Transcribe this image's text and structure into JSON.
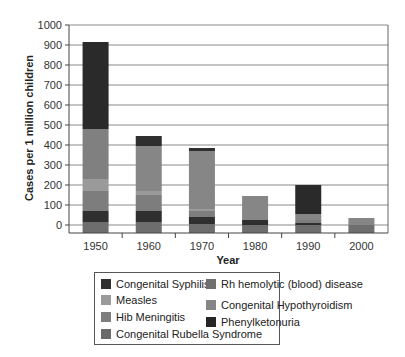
{
  "chart_data": {
    "type": "bar",
    "stacked": true,
    "title": "",
    "xlabel": "Year",
    "ylabel": "Cases per 1 million children",
    "ylim": [
      -50,
      1000
    ],
    "yticks": [
      0,
      100,
      200,
      300,
      400,
      500,
      600,
      700,
      800,
      900,
      1000
    ],
    "grid": true,
    "legend_position": "bottom",
    "categories": [
      "1950",
      "1960",
      "1970",
      "1980",
      "1990",
      "2000"
    ],
    "series": [
      {
        "name": "Congenital Rubella Syndrome",
        "color": "#6e6e6e",
        "values": [
          55,
          55,
          45,
          40,
          40,
          40
        ]
      },
      {
        "name": "Congenital Syphilis",
        "color": "#2f2f2f",
        "values": [
          55,
          55,
          35,
          25,
          10,
          0
        ]
      },
      {
        "name": "Hib Meningitis",
        "color": "#7d7d7d",
        "values": [
          100,
          80,
          30,
          0,
          15,
          0
        ]
      },
      {
        "name": "Measles",
        "color": "#9a9a9a",
        "values": [
          60,
          20,
          10,
          0,
          0,
          0
        ]
      },
      {
        "name": "Rh hemolytic (blood) disease",
        "color": "#808080",
        "values": [
          250,
          0,
          0,
          0,
          0,
          0
        ]
      },
      {
        "name": "Congenital Hypothyroidism",
        "color": "#868686",
        "values": [
          0,
          225,
          290,
          120,
          30,
          35
        ]
      },
      {
        "name": "Phenylketonuria",
        "color": "#2a2a2a",
        "values": [
          435,
          0,
          0,
          0,
          0,
          0
        ]
      },
      {
        "name": "Congenital Syphilis (upper band)",
        "color": "#2f2f2f",
        "values": [
          0,
          50,
          15,
          0,
          0,
          0
        ]
      },
      {
        "name": "Phenylketonuria (1990)",
        "color": "#2a2a2a",
        "values": [
          0,
          0,
          0,
          0,
          145,
          0
        ]
      }
    ],
    "totals_approx": [
      915,
      485,
      425,
      145,
      200,
      35
    ],
    "legend": [
      {
        "label": "Congenital Syphilis",
        "color": "#303030"
      },
      {
        "label": "Measles",
        "color": "#9a9a9a"
      },
      {
        "label": "Hib Meningitis",
        "color": "#7e7e7e"
      },
      {
        "label": "Congenital Rubella Syndrome",
        "color": "#6a6a6a"
      },
      {
        "label": "Rh hemolytic (blood) disease",
        "color": "#707070"
      },
      {
        "label": "Congenital Hypothyroidism",
        "color": "#868686"
      },
      {
        "label": "Phenylketonuria",
        "color": "#262626"
      }
    ]
  }
}
